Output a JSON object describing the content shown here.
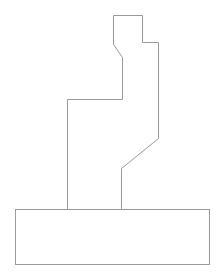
{
  "diagram": {
    "width": 218,
    "height": 278,
    "background": "#ffffff",
    "stroke": "#9a9a9a",
    "stroke_width": 1,
    "upper_outline": {
      "points": [
        [
          67,
          209
        ],
        [
          67,
          99
        ],
        [
          122,
          99
        ],
        [
          122,
          57
        ],
        [
          113,
          44
        ],
        [
          113,
          15
        ],
        [
          142,
          15
        ],
        [
          142,
          42
        ],
        [
          158,
          42
        ],
        [
          158,
          138
        ],
        [
          121,
          168
        ],
        [
          121,
          209
        ]
      ]
    },
    "base_rect": {
      "x": 15,
      "y": 209,
      "width": 194,
      "height": 55
    }
  }
}
